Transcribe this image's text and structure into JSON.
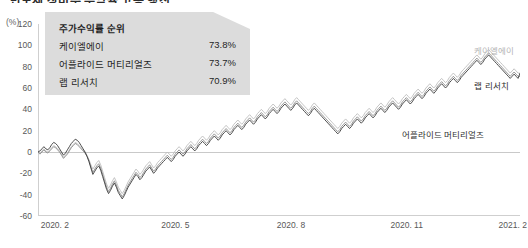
{
  "headline": "반도체 장비주 수익률 고공 행진",
  "axis_unit": "(%)",
  "callout": {
    "title": "주가수익률 순위",
    "rows": [
      {
        "name": "케이엘에이",
        "value": "73.8%"
      },
      {
        "name": "어플라이드 머티리얼즈",
        "value": "73.7%"
      },
      {
        "name": "랩 리서치",
        "value": "70.9%"
      }
    ]
  },
  "series_labels": [
    {
      "key": "kla",
      "text": "케이엘에이"
    },
    {
      "key": "lam",
      "text": "랩 리서치"
    },
    {
      "key": "amat",
      "text": "어플라이드 머티리얼즈"
    }
  ],
  "colors": {
    "kla": "#bdbdbd",
    "lam": "#8c8c8c",
    "amat": "#3a3a3a",
    "axis": "#cfcfcf",
    "zero": "#c9c9c9",
    "callout_bg": "#dcdcdc",
    "text": "#585858"
  },
  "chart_data": {
    "type": "line",
    "title": "반도체 장비주 수익률 고공 행진",
    "xlabel": "",
    "ylabel": "(%)",
    "ylim": [
      -60,
      120
    ],
    "ytick_values": [
      120,
      100,
      80,
      60,
      40,
      20,
      0,
      -20,
      -40,
      -60
    ],
    "ytick_labels": [
      "120",
      "100",
      "80",
      "60",
      "40",
      "20",
      "0",
      "-20",
      "-40",
      "-60"
    ],
    "grid": false,
    "zero_line": true,
    "legend_position": "inline-right",
    "x_axis_type": "date",
    "xtick_labels": [
      "2020. 2",
      "2020. 5",
      "2020. 8",
      "2020. 11",
      "2021. 2"
    ],
    "xtick_fractions": [
      0.035,
      0.285,
      0.525,
      0.765,
      0.985
    ],
    "x_domain": [
      "2020-02-01",
      "2021-02-10"
    ],
    "annotations": [
      {
        "text": "케이엘에이",
        "x_fraction": 0.905,
        "y_value": 96
      },
      {
        "text": "랩 리서치",
        "x_fraction": 0.905,
        "y_value": 63
      },
      {
        "text": "어플라이드 머티리얼즈",
        "x_fraction": 0.755,
        "y_value": 17
      }
    ],
    "series": [
      {
        "name": "케이엘에이",
        "color": "#bdbdbd",
        "final_value": 73.8,
        "values": [
          0,
          -1,
          1,
          3,
          1,
          0,
          2,
          4,
          6,
          5,
          3,
          1,
          -2,
          -5,
          -3,
          -1,
          2,
          5,
          7,
          9,
          8,
          6,
          4,
          2,
          0,
          -3,
          -7,
          -12,
          -16,
          -13,
          -10,
          -8,
          -12,
          -18,
          -24,
          -30,
          -34,
          -31,
          -27,
          -24,
          -28,
          -33,
          -36,
          -39,
          -36,
          -32,
          -28,
          -25,
          -22,
          -19,
          -16,
          -18,
          -21,
          -19,
          -16,
          -13,
          -11,
          -9,
          -12,
          -15,
          -13,
          -10,
          -8,
          -6,
          -4,
          -2,
          0,
          -2,
          -4,
          -2,
          1,
          3,
          5,
          3,
          1,
          3,
          6,
          8,
          10,
          8,
          6,
          8,
          11,
          13,
          15,
          13,
          11,
          13,
          16,
          18,
          20,
          18,
          16,
          18,
          21,
          23,
          25,
          23,
          21,
          23,
          26,
          28,
          30,
          28,
          26,
          28,
          31,
          33,
          35,
          33,
          31,
          33,
          36,
          38,
          40,
          38,
          36,
          38,
          41,
          43,
          45,
          43,
          41,
          43,
          46,
          48,
          50,
          48,
          46,
          44,
          46,
          49,
          51,
          49,
          47,
          45,
          43,
          41,
          39,
          41,
          44,
          46,
          44,
          42,
          40,
          38,
          36,
          34,
          32,
          30,
          28,
          26,
          24,
          22,
          24,
          27,
          29,
          31,
          29,
          27,
          29,
          32,
          34,
          36,
          34,
          32,
          34,
          37,
          39,
          41,
          39,
          37,
          39,
          42,
          44,
          46,
          44,
          42,
          44,
          47,
          49,
          51,
          49,
          47,
          45,
          47,
          50,
          52,
          54,
          52,
          50,
          52,
          55,
          57,
          59,
          57,
          55,
          57,
          60,
          62,
          64,
          62,
          60,
          62,
          65,
          67,
          69,
          67,
          65,
          67,
          70,
          72,
          74,
          72,
          70,
          72,
          75,
          77,
          79,
          81,
          83,
          85,
          87,
          89,
          91,
          89,
          87,
          89,
          92,
          94,
          96,
          94,
          92,
          90,
          88,
          86,
          84,
          82,
          80,
          78,
          76,
          74,
          76,
          78,
          76,
          74,
          73.8
        ]
      },
      {
        "name": "랩 리서치",
        "color": "#8c8c8c",
        "final_value": 70.9,
        "values": [
          0,
          -2,
          0,
          2,
          0,
          -1,
          1,
          3,
          5,
          4,
          2,
          0,
          -3,
          -6,
          -4,
          -2,
          1,
          4,
          6,
          8,
          7,
          5,
          3,
          1,
          -1,
          -4,
          -8,
          -14,
          -19,
          -16,
          -13,
          -11,
          -15,
          -21,
          -27,
          -33,
          -37,
          -34,
          -30,
          -27,
          -31,
          -36,
          -39,
          -42,
          -39,
          -35,
          -31,
          -28,
          -25,
          -22,
          -19,
          -21,
          -24,
          -22,
          -19,
          -16,
          -14,
          -12,
          -15,
          -18,
          -16,
          -13,
          -11,
          -9,
          -7,
          -5,
          -3,
          -5,
          -7,
          -5,
          -2,
          0,
          2,
          0,
          -2,
          0,
          3,
          5,
          7,
          5,
          3,
          5,
          8,
          10,
          12,
          10,
          8,
          10,
          13,
          15,
          17,
          15,
          13,
          15,
          18,
          20,
          22,
          20,
          18,
          20,
          23,
          25,
          27,
          25,
          23,
          25,
          28,
          30,
          32,
          30,
          28,
          30,
          33,
          35,
          37,
          35,
          33,
          35,
          38,
          40,
          42,
          40,
          38,
          40,
          43,
          45,
          47,
          45,
          43,
          41,
          43,
          46,
          48,
          46,
          44,
          42,
          40,
          38,
          36,
          38,
          41,
          43,
          41,
          39,
          37,
          35,
          33,
          31,
          29,
          27,
          25,
          23,
          21,
          19,
          21,
          24,
          26,
          28,
          26,
          24,
          26,
          29,
          31,
          33,
          31,
          29,
          31,
          34,
          36,
          38,
          36,
          34,
          36,
          39,
          41,
          43,
          41,
          39,
          41,
          44,
          46,
          48,
          46,
          44,
          42,
          44,
          47,
          49,
          51,
          49,
          47,
          49,
          52,
          54,
          56,
          54,
          52,
          54,
          57,
          59,
          61,
          59,
          57,
          59,
          62,
          64,
          66,
          64,
          62,
          64,
          67,
          69,
          71,
          69,
          67,
          69,
          72,
          74,
          76,
          78,
          80,
          82,
          84,
          86,
          88,
          86,
          84,
          86,
          89,
          91,
          93,
          91,
          89,
          87,
          85,
          83,
          81,
          79,
          77,
          75,
          73,
          71,
          73,
          75,
          73,
          71,
          70.9
        ]
      },
      {
        "name": "어플라이드 머티리얼즈",
        "color": "#3a3a3a",
        "final_value": 73.7,
        "values": [
          0,
          1,
          3,
          5,
          3,
          2,
          4,
          7,
          9,
          8,
          6,
          3,
          0,
          -3,
          -1,
          2,
          5,
          8,
          10,
          12,
          11,
          9,
          6,
          3,
          0,
          -4,
          -9,
          -15,
          -21,
          -18,
          -15,
          -13,
          -17,
          -23,
          -29,
          -35,
          -39,
          -36,
          -32,
          -29,
          -33,
          -38,
          -41,
          -44,
          -41,
          -37,
          -33,
          -30,
          -27,
          -24,
          -21,
          -23,
          -26,
          -24,
          -21,
          -18,
          -16,
          -14,
          -17,
          -20,
          -18,
          -15,
          -13,
          -11,
          -9,
          -7,
          -5,
          -7,
          -9,
          -7,
          -4,
          -2,
          0,
          -2,
          -4,
          -2,
          1,
          3,
          5,
          3,
          1,
          3,
          6,
          8,
          10,
          8,
          6,
          8,
          11,
          13,
          15,
          13,
          11,
          13,
          16,
          18,
          20,
          18,
          16,
          18,
          21,
          23,
          25,
          23,
          21,
          23,
          26,
          28,
          30,
          28,
          26,
          28,
          31,
          33,
          35,
          33,
          31,
          33,
          36,
          38,
          40,
          38,
          36,
          38,
          41,
          43,
          45,
          43,
          41,
          39,
          41,
          44,
          46,
          44,
          42,
          40,
          38,
          36,
          34,
          36,
          39,
          41,
          39,
          37,
          35,
          33,
          31,
          29,
          27,
          25,
          23,
          21,
          19,
          17,
          19,
          22,
          24,
          26,
          24,
          22,
          24,
          27,
          29,
          31,
          29,
          27,
          29,
          32,
          34,
          36,
          34,
          32,
          34,
          37,
          39,
          41,
          39,
          37,
          39,
          42,
          44,
          46,
          44,
          42,
          40,
          42,
          45,
          47,
          49,
          47,
          45,
          47,
          50,
          52,
          54,
          52,
          50,
          52,
          55,
          57,
          59,
          57,
          55,
          57,
          60,
          62,
          64,
          62,
          60,
          62,
          65,
          67,
          69,
          67,
          65,
          67,
          70,
          72,
          74,
          76,
          78,
          80,
          82,
          84,
          86,
          84,
          82,
          84,
          87,
          89,
          91,
          89,
          87,
          85,
          83,
          81,
          79,
          77,
          75,
          73,
          71,
          69,
          71,
          73,
          71,
          69,
          73.7
        ]
      }
    ]
  }
}
